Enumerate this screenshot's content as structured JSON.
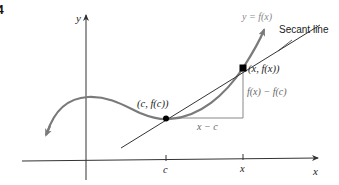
{
  "figure": {
    "number": "4",
    "axes": {
      "x_label": "x",
      "y_label": "y"
    },
    "curve_label": "y = f(x)",
    "secant_label": "Secant line",
    "points": [
      {
        "label": "(c, f(c))"
      },
      {
        "label": "(x, f(x))"
      }
    ],
    "rise_label": "f(x) − f(c)",
    "run_label": "x − c",
    "ticks": [
      {
        "label": "c"
      },
      {
        "label": "x"
      }
    ],
    "colors": {
      "curve": "#7a7a7a",
      "lines": "#333333",
      "guide": "#888888",
      "points": "#000000"
    }
  }
}
